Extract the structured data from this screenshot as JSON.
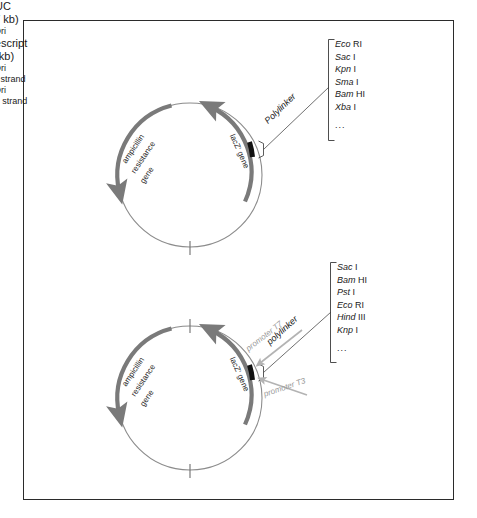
{
  "figure": {
    "border_color": "#2b2b2b",
    "background": "#ffffff",
    "arc_gray": "#7a7a7a",
    "circle_gray": "#8c8c8c",
    "polylinker_black": "#111111",
    "promoter_gray": "#b0b0b0"
  },
  "plasmids": [
    {
      "id": "puc",
      "name": "pUC",
      "size": "(2.7 kb)",
      "ori_label": "Ori",
      "amp_gene": {
        "line1": "ampicillin",
        "line2": "resistance",
        "line3": "gene"
      },
      "lacz_gene": "lacZ' gene",
      "polylinker_label": "Polylinker",
      "enzymes": [
        {
          "name": "Eco",
          "num": "RI"
        },
        {
          "name": "Sac",
          "num": "I"
        },
        {
          "name": "Kpn",
          "num": "I"
        },
        {
          "name": "Sma",
          "num": "I"
        },
        {
          "name": "Bam",
          "num": "HI"
        },
        {
          "name": "Xba",
          "num": "I"
        }
      ],
      "enzymes_ellipsis": "..."
    },
    {
      "id": "pbluescript",
      "name": "pBluescript",
      "size": "(3 kb)",
      "ori_top_line1": "Ori",
      "ori_top_line2": "single strand",
      "ori_bottom_line1": "Ori",
      "ori_bottom_line2": "double strand",
      "amp_gene": {
        "line1": "ampicillin",
        "line2": "resistance",
        "line3": "gene"
      },
      "lacz_gene": "lacZ' gene",
      "polylinker_label": "polylinker",
      "promoter_t7": "promoter T7",
      "promoter_t3": "promoter T3",
      "enzymes": [
        {
          "name": "Sac",
          "num": "I"
        },
        {
          "name": "Bam",
          "num": "HI"
        },
        {
          "name": "Pst",
          "num": "I"
        },
        {
          "name": "Eco",
          "num": "RI"
        },
        {
          "name": "Hind",
          "num": "III"
        },
        {
          "name": "Knp",
          "num": "I"
        }
      ],
      "enzymes_ellipsis": "..."
    }
  ]
}
